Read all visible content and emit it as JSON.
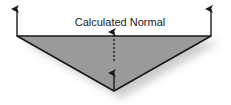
{
  "diagram": {
    "title": "Calculated Normal",
    "label": "Calculated Normal",
    "colors": {
      "face_fill": "#9a9a9a",
      "edge": "#1a1a1a",
      "arrow": "#1a1a1a",
      "shadow": "#cfcfcf",
      "background": "#ffffff"
    },
    "elements": [
      {
        "type": "triangle",
        "vertices": [
          [
            17,
            36
          ],
          [
            211,
            36
          ],
          [
            114,
            91
          ]
        ]
      },
      {
        "type": "arrow",
        "name": "left-vertex-normal",
        "from": [
          17,
          36
        ],
        "to": [
          17,
          8
        ],
        "style": "solid"
      },
      {
        "type": "arrow",
        "name": "right-vertex-normal",
        "from": [
          211,
          36
        ],
        "to": [
          211,
          8
        ],
        "style": "solid"
      },
      {
        "type": "arrow",
        "name": "bottom-vertex-normal",
        "from": [
          114,
          91
        ],
        "to": [
          114,
          72
        ],
        "style": "solid"
      },
      {
        "type": "arrow",
        "name": "calculated-normal",
        "from": [
          114,
          61
        ],
        "to": [
          114,
          31
        ],
        "style": "dashed"
      }
    ]
  }
}
